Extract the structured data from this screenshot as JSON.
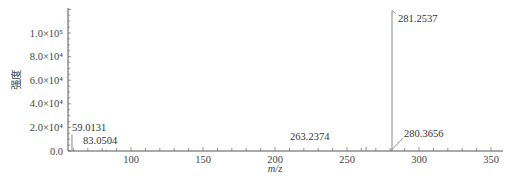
{
  "chart_data": {
    "type": "bar",
    "subtype": "mass-spectrum-stick",
    "title": "",
    "xlabel": "m/z",
    "ylabel": "强度",
    "xlim": [
      57,
      355
    ],
    "ylim": [
      0,
      120000
    ],
    "x_ticks": [
      100,
      150,
      200,
      250,
      300,
      350
    ],
    "x_tick_labels": [
      "100",
      "150",
      "200",
      "250",
      "300",
      "350"
    ],
    "y_ticks": [
      0,
      20000,
      40000,
      60000,
      80000,
      100000
    ],
    "y_tick_labels": [
      "0.0",
      "2.0×10⁴",
      "4.0×10⁴",
      "6.0×10⁴",
      "8.0×10⁴",
      "1.0×10⁵"
    ],
    "grid": false,
    "legend": null,
    "peaks": [
      {
        "mz": 59.0131,
        "intensity": 14000,
        "label": "59.0131"
      },
      {
        "mz": 83.0504,
        "intensity": 1200,
        "label": "83.0504"
      },
      {
        "mz": 263.2374,
        "intensity": 3500,
        "label": "263.2374"
      },
      {
        "mz": 280.3656,
        "intensity": 600,
        "label": "280.3656"
      },
      {
        "mz": 281.2537,
        "intensity": 119000,
        "label": "281.2537"
      }
    ]
  },
  "axis": {
    "xlabel": "m/z",
    "ylabel": "强度",
    "y_tick_labels": [
      "0.0",
      "2.0×10⁴",
      "4.0×10⁴",
      "6.0×10⁴",
      "8.0×10⁴",
      "1.0×10⁵"
    ],
    "x_tick_labels": [
      "100",
      "150",
      "200",
      "250",
      "300",
      "350"
    ]
  }
}
